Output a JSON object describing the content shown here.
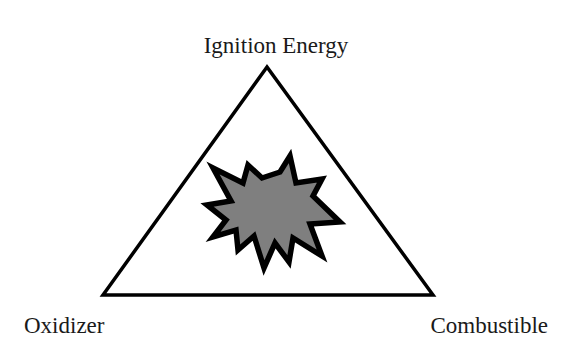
{
  "diagram": {
    "labels": {
      "top": "Ignition Energy",
      "bottom_left": "Oxidizer",
      "bottom_right": "Combustible"
    },
    "center_icon": "explosion-burst-icon",
    "colors": {
      "background": "#ffffff",
      "stroke": "#000000",
      "burst_fill": "#7f7f7f",
      "text": "#1a1a1a"
    }
  }
}
